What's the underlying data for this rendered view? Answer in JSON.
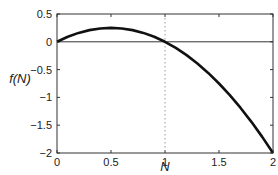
{
  "chart_data": {
    "type": "line",
    "title": "",
    "xlabel": "N",
    "ylabel": "f(N)",
    "xlim": [
      0,
      2
    ],
    "ylim": [
      -2,
      0.5
    ],
    "x_ticks": [
      0,
      0.5,
      1,
      1.5,
      2
    ],
    "x_tick_labels": [
      "0",
      "0.5",
      "1",
      "1.5",
      "2"
    ],
    "y_ticks": [
      0.5,
      0,
      -0.5,
      -1,
      -1.5,
      -2
    ],
    "y_tick_labels": [
      "0.5",
      "0",
      "−0.5",
      "−1",
      "−1.5",
      "−2"
    ],
    "grid": false,
    "annotations": [
      {
        "type": "hline",
        "y": 0,
        "style": "solid"
      },
      {
        "type": "vline",
        "x": 1,
        "style": "dotted"
      }
    ],
    "series": [
      {
        "name": "f(N)",
        "color": "#111111",
        "x": [
          0,
          0.1,
          0.2,
          0.3,
          0.4,
          0.5,
          0.6,
          0.7,
          0.8,
          0.9,
          1.0,
          1.1,
          1.2,
          1.3,
          1.4,
          1.5,
          1.6,
          1.7,
          1.8,
          1.9,
          2.0
        ],
        "values": [
          0,
          0.09,
          0.16,
          0.21,
          0.24,
          0.25,
          0.24,
          0.21,
          0.16,
          0.09,
          0,
          -0.11,
          -0.24,
          -0.39,
          -0.56,
          -0.75,
          -0.96,
          -1.19,
          -1.44,
          -1.71,
          -2.0
        ]
      }
    ]
  }
}
